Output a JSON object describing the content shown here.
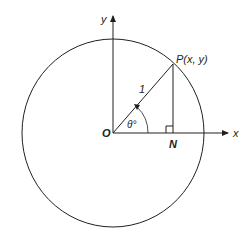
{
  "diagram": {
    "type": "unit-circle-trigonometry",
    "labels": {
      "y_axis": "y",
      "x_axis": "x",
      "origin": "O",
      "point": "P(x, y)",
      "foot": "N",
      "radius": "1",
      "angle": "θ°"
    },
    "colors": {
      "stroke": "#231f20",
      "background": "#ffffff"
    }
  }
}
